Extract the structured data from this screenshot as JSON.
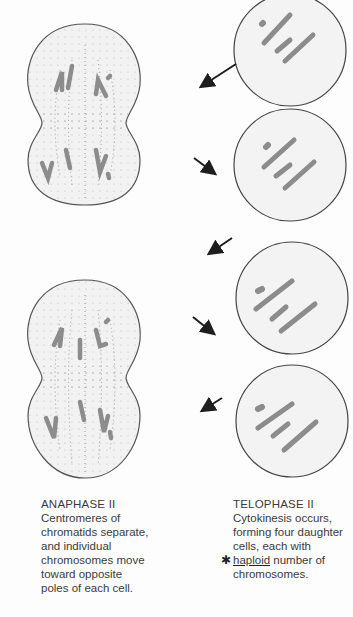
{
  "figure": {
    "left_column": {
      "cells": [
        {
          "name": "anaphase-ii-cell-1",
          "stage": "Anaphase II"
        },
        {
          "name": "anaphase-ii-cell-2",
          "stage": "Anaphase II"
        }
      ]
    },
    "right_column": {
      "cells": [
        {
          "name": "telophase-ii-daughter-cell-1"
        },
        {
          "name": "telophase-ii-daughter-cell-2"
        },
        {
          "name": "telophase-ii-daughter-cell-3"
        },
        {
          "name": "telophase-ii-daughter-cell-4"
        }
      ]
    },
    "colors": {
      "cell_outline": "#555555",
      "cell_fill": "#f1f1f1",
      "chromosome": "#8c8c8c",
      "spindle_dots": "#7a7a7a",
      "arrow": "#1e1e1e"
    }
  },
  "captions": {
    "left": {
      "title": "ANAPHASE II",
      "lines": [
        "Centromeres of",
        "chromatids separate,",
        "and individual",
        "chromosomes move",
        "toward opposite",
        "poles of each cell."
      ]
    },
    "right": {
      "title": "TELOPHASE II",
      "lines": [
        "Cytokinesis occurs,",
        "forming four daughter",
        "cells, each with"
      ],
      "annotated_word": "haploid",
      "annotation_mark": "✱",
      "line4_rest": " number of",
      "line5": "chromosomes."
    }
  }
}
